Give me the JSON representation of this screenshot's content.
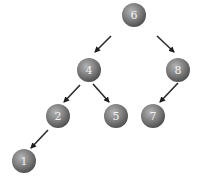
{
  "diagram": {
    "type": "binary-search-tree",
    "colors": {
      "node_light": "#a8a8a8",
      "node_mid": "#7a7a7a",
      "node_dark": "#4e4e4e",
      "label": "#f2f2f2",
      "edge": "#2a2a2a",
      "background": "#ffffff"
    },
    "nodes": [
      {
        "id": "n6",
        "label": "6",
        "cx": 134,
        "cy": 15
      },
      {
        "id": "n4",
        "label": "4",
        "cx": 89,
        "cy": 70
      },
      {
        "id": "n8",
        "label": "8",
        "cx": 178,
        "cy": 70
      },
      {
        "id": "n2",
        "label": "2",
        "cx": 58,
        "cy": 116
      },
      {
        "id": "n5",
        "label": "5",
        "cx": 116,
        "cy": 116
      },
      {
        "id": "n7",
        "label": "7",
        "cx": 153,
        "cy": 116
      },
      {
        "id": "n1",
        "label": "1",
        "cx": 24,
        "cy": 161
      }
    ],
    "edges": [
      {
        "from": "6",
        "to": "4",
        "x1": 111,
        "y1": 36,
        "x2": 95,
        "y2": 52
      },
      {
        "from": "6",
        "to": "8",
        "x1": 157,
        "y1": 36,
        "x2": 174,
        "y2": 52
      },
      {
        "from": "4",
        "to": "2",
        "x1": 80,
        "y1": 85,
        "x2": 64,
        "y2": 102
      },
      {
        "from": "4",
        "to": "5",
        "x1": 93,
        "y1": 84,
        "x2": 109,
        "y2": 102
      },
      {
        "from": "8",
        "to": "7",
        "x1": 178,
        "y1": 83,
        "x2": 160,
        "y2": 102
      },
      {
        "from": "2",
        "to": "1",
        "x1": 48,
        "y1": 130,
        "x2": 31,
        "y2": 148
      }
    ]
  }
}
